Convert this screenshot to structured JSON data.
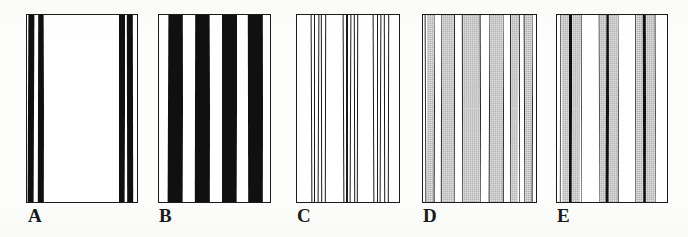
{
  "figure": {
    "background_color": "#fdfdfc",
    "panel_count": 5,
    "ink_color": "#1b1b1b",
    "gray_color": "#b3b3b3",
    "white_color": "#ffffff"
  },
  "panels": [
    {
      "id": "A",
      "label": "A",
      "description": "White field with two narrow black bar pairs near left and right edges",
      "rect": {
        "x": 26,
        "y": 14,
        "width": 112,
        "height": 189
      },
      "label_pos": {
        "x": 28,
        "y": 206
      },
      "fill": "#ffffff",
      "stripes": [
        {
          "left_pct": 1.5,
          "width_pct": 5.0,
          "color": "#101010",
          "kind": "black"
        },
        {
          "left_pct": 8.5,
          "width_pct": 2.0,
          "color": "#ffffff",
          "kind": "white"
        },
        {
          "left_pct": 10.5,
          "width_pct": 5.5,
          "color": "#101010",
          "kind": "black"
        },
        {
          "left_pct": 16.0,
          "width_pct": 67.0,
          "color": "#ffffff",
          "kind": "white"
        },
        {
          "left_pct": 83.0,
          "width_pct": 5.5,
          "color": "#101010",
          "kind": "black"
        },
        {
          "left_pct": 88.5,
          "width_pct": 2.0,
          "color": "#ffffff",
          "kind": "white"
        },
        {
          "left_pct": 90.5,
          "width_pct": 5.5,
          "color": "#101010",
          "kind": "black"
        }
      ]
    },
    {
      "id": "B",
      "label": "B",
      "description": "Four wide black stripes alternating with five white stripes",
      "rect": {
        "x": 158,
        "y": 14,
        "width": 113,
        "height": 189
      },
      "label_pos": {
        "x": 159,
        "y": 206
      },
      "fill": "#ffffff",
      "stripes": [
        {
          "left_pct": 0.0,
          "width_pct": 9.0,
          "color": "#ffffff",
          "kind": "white"
        },
        {
          "left_pct": 9.0,
          "width_pct": 13.0,
          "color": "#101010",
          "kind": "black"
        },
        {
          "left_pct": 22.0,
          "width_pct": 11.0,
          "color": "#ffffff",
          "kind": "white"
        },
        {
          "left_pct": 33.0,
          "width_pct": 13.0,
          "color": "#101010",
          "kind": "black"
        },
        {
          "left_pct": 46.0,
          "width_pct": 11.0,
          "color": "#ffffff",
          "kind": "white"
        },
        {
          "left_pct": 57.0,
          "width_pct": 13.0,
          "color": "#101010",
          "kind": "black"
        },
        {
          "left_pct": 70.0,
          "width_pct": 10.0,
          "color": "#ffffff",
          "kind": "white"
        },
        {
          "left_pct": 80.0,
          "width_pct": 13.0,
          "color": "#101010",
          "kind": "black"
        },
        {
          "left_pct": 93.0,
          "width_pct": 7.0,
          "color": "#ffffff",
          "kind": "white"
        }
      ]
    },
    {
      "id": "C",
      "label": "C",
      "description": "White field with three groups of thin black vertical lines",
      "rect": {
        "x": 296,
        "y": 14,
        "width": 104,
        "height": 189
      },
      "label_pos": {
        "x": 297,
        "y": 206
      },
      "fill": "#ffffff",
      "stripes": [
        {
          "left_pct": 14.0,
          "width_pct": 1.2,
          "color": "#1b1b1b",
          "kind": "line"
        },
        {
          "left_pct": 17.5,
          "width_pct": 1.2,
          "color": "#1b1b1b",
          "kind": "line"
        },
        {
          "left_pct": 21.0,
          "width_pct": 1.2,
          "color": "#1b1b1b",
          "kind": "line"
        },
        {
          "left_pct": 24.5,
          "width_pct": 1.2,
          "color": "#1b1b1b",
          "kind": "line"
        },
        {
          "left_pct": 28.0,
          "width_pct": 1.2,
          "color": "#1b1b1b",
          "kind": "line"
        },
        {
          "left_pct": 45.0,
          "width_pct": 1.2,
          "color": "#1b1b1b",
          "kind": "line"
        },
        {
          "left_pct": 48.5,
          "width_pct": 1.2,
          "color": "#1b1b1b",
          "kind": "line"
        },
        {
          "left_pct": 52.0,
          "width_pct": 1.2,
          "color": "#1b1b1b",
          "kind": "line"
        },
        {
          "left_pct": 55.5,
          "width_pct": 1.2,
          "color": "#1b1b1b",
          "kind": "line"
        },
        {
          "left_pct": 59.0,
          "width_pct": 1.2,
          "color": "#1b1b1b",
          "kind": "line"
        },
        {
          "left_pct": 74.0,
          "width_pct": 1.2,
          "color": "#1b1b1b",
          "kind": "line"
        },
        {
          "left_pct": 77.5,
          "width_pct": 1.2,
          "color": "#1b1b1b",
          "kind": "line"
        },
        {
          "left_pct": 81.0,
          "width_pct": 1.2,
          "color": "#1b1b1b",
          "kind": "line"
        },
        {
          "left_pct": 84.5,
          "width_pct": 1.2,
          "color": "#1b1b1b",
          "kind": "line"
        },
        {
          "left_pct": 88.0,
          "width_pct": 1.2,
          "color": "#1b1b1b",
          "kind": "line"
        }
      ]
    },
    {
      "id": "D",
      "label": "D",
      "description": "Alternating gray and white stripes bounded by thin dark outlines",
      "rect": {
        "x": 422,
        "y": 14,
        "width": 115,
        "height": 189
      },
      "label_pos": {
        "x": 423,
        "y": 206
      },
      "fill": "#ffffff",
      "stripes": [
        {
          "left_pct": 0.0,
          "width_pct": 3.0,
          "color": "#ffffff",
          "kind": "white"
        },
        {
          "left_pct": 3.0,
          "width_pct": 1.0,
          "color": "#2a2a2a",
          "kind": "line"
        },
        {
          "left_pct": 4.0,
          "width_pct": 6.5,
          "color": "#b3b3b3",
          "kind": "gray"
        },
        {
          "left_pct": 10.5,
          "width_pct": 1.0,
          "color": "#2a2a2a",
          "kind": "line"
        },
        {
          "left_pct": 11.5,
          "width_pct": 5.0,
          "color": "#ffffff",
          "kind": "white"
        },
        {
          "left_pct": 16.5,
          "width_pct": 1.0,
          "color": "#2a2a2a",
          "kind": "line"
        },
        {
          "left_pct": 17.5,
          "width_pct": 10.0,
          "color": "#b3b3b3",
          "kind": "gray"
        },
        {
          "left_pct": 27.5,
          "width_pct": 1.0,
          "color": "#2a2a2a",
          "kind": "line"
        },
        {
          "left_pct": 28.5,
          "width_pct": 6.0,
          "color": "#ffffff",
          "kind": "white"
        },
        {
          "left_pct": 34.5,
          "width_pct": 1.0,
          "color": "#2a2a2a",
          "kind": "line"
        },
        {
          "left_pct": 35.5,
          "width_pct": 15.0,
          "color": "#b3b3b3",
          "kind": "gray"
        },
        {
          "left_pct": 50.5,
          "width_pct": 1.0,
          "color": "#2a2a2a",
          "kind": "line"
        },
        {
          "left_pct": 51.5,
          "width_pct": 7.0,
          "color": "#ffffff",
          "kind": "white"
        },
        {
          "left_pct": 58.5,
          "width_pct": 1.0,
          "color": "#2a2a2a",
          "kind": "line"
        },
        {
          "left_pct": 59.5,
          "width_pct": 11.0,
          "color": "#b3b3b3",
          "kind": "gray"
        },
        {
          "left_pct": 70.5,
          "width_pct": 1.0,
          "color": "#2a2a2a",
          "kind": "line"
        },
        {
          "left_pct": 71.5,
          "width_pct": 5.0,
          "color": "#ffffff",
          "kind": "white"
        },
        {
          "left_pct": 76.5,
          "width_pct": 1.0,
          "color": "#2a2a2a",
          "kind": "line"
        },
        {
          "left_pct": 77.5,
          "width_pct": 6.5,
          "color": "#b3b3b3",
          "kind": "gray"
        },
        {
          "left_pct": 84.0,
          "width_pct": 1.0,
          "color": "#2a2a2a",
          "kind": "line"
        },
        {
          "left_pct": 85.0,
          "width_pct": 3.5,
          "color": "#ffffff",
          "kind": "white"
        },
        {
          "left_pct": 88.5,
          "width_pct": 1.0,
          "color": "#2a2a2a",
          "kind": "line"
        },
        {
          "left_pct": 89.5,
          "width_pct": 6.0,
          "color": "#b3b3b3",
          "kind": "gray"
        },
        {
          "left_pct": 95.5,
          "width_pct": 1.0,
          "color": "#2a2a2a",
          "kind": "line"
        },
        {
          "left_pct": 96.5,
          "width_pct": 3.5,
          "color": "#ffffff",
          "kind": "white"
        }
      ]
    },
    {
      "id": "E",
      "label": "E",
      "description": "Three gray bands each split by a bold black line, separated by white",
      "rect": {
        "x": 556,
        "y": 14,
        "width": 112,
        "height": 189
      },
      "label_pos": {
        "x": 557,
        "y": 206
      },
      "fill": "#ffffff",
      "stripes": [
        {
          "left_pct": 0.0,
          "width_pct": 4.0,
          "color": "#ffffff",
          "kind": "white"
        },
        {
          "left_pct": 4.0,
          "width_pct": 1.0,
          "color": "#555555",
          "kind": "line"
        },
        {
          "left_pct": 5.0,
          "width_pct": 7.0,
          "color": "#b3b3b3",
          "kind": "gray"
        },
        {
          "left_pct": 12.0,
          "width_pct": 2.5,
          "color": "#101010",
          "kind": "black"
        },
        {
          "left_pct": 14.5,
          "width_pct": 7.5,
          "color": "#b3b3b3",
          "kind": "gray"
        },
        {
          "left_pct": 22.0,
          "width_pct": 1.0,
          "color": "#555555",
          "kind": "line"
        },
        {
          "left_pct": 23.0,
          "width_pct": 15.0,
          "color": "#ffffff",
          "kind": "white"
        },
        {
          "left_pct": 38.0,
          "width_pct": 1.0,
          "color": "#555555",
          "kind": "line"
        },
        {
          "left_pct": 39.0,
          "width_pct": 6.0,
          "color": "#b3b3b3",
          "kind": "gray"
        },
        {
          "left_pct": 45.0,
          "width_pct": 2.5,
          "color": "#101010",
          "kind": "black"
        },
        {
          "left_pct": 47.5,
          "width_pct": 8.0,
          "color": "#b3b3b3",
          "kind": "gray"
        },
        {
          "left_pct": 55.5,
          "width_pct": 1.0,
          "color": "#555555",
          "kind": "line"
        },
        {
          "left_pct": 56.5,
          "width_pct": 14.0,
          "color": "#ffffff",
          "kind": "white"
        },
        {
          "left_pct": 70.5,
          "width_pct": 1.0,
          "color": "#555555",
          "kind": "line"
        },
        {
          "left_pct": 71.5,
          "width_pct": 6.0,
          "color": "#b3b3b3",
          "kind": "gray"
        },
        {
          "left_pct": 77.5,
          "width_pct": 2.5,
          "color": "#101010",
          "kind": "black"
        },
        {
          "left_pct": 80.0,
          "width_pct": 8.0,
          "color": "#b3b3b3",
          "kind": "gray"
        },
        {
          "left_pct": 88.0,
          "width_pct": 1.0,
          "color": "#555555",
          "kind": "line"
        },
        {
          "left_pct": 89.0,
          "width_pct": 11.0,
          "color": "#ffffff",
          "kind": "white"
        }
      ]
    }
  ]
}
